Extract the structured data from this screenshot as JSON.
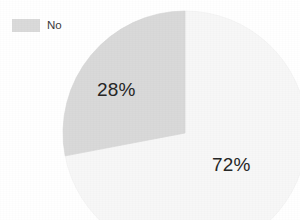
{
  "chart_data": {
    "type": "pie",
    "title": "",
    "subtitle": "",
    "xlabel": "",
    "ylabel": "",
    "grid": false,
    "legend_position": "top-left",
    "categories": [
      "No",
      "Yes"
    ],
    "values": [
      28,
      72
    ],
    "value_labels": [
      "28%",
      "72%"
    ],
    "slices": [
      {
        "label": "No",
        "value": 28,
        "value_label": "28%",
        "color": "#d9d9d9",
        "start_angle_deg": 259.2,
        "end_angle_deg": 360.0,
        "legend_visible": true
      },
      {
        "label": "",
        "value": 72,
        "value_label": "72%",
        "color": "#f7f7f7",
        "start_angle_deg": 0.0,
        "end_angle_deg": 259.2,
        "legend_visible": false
      }
    ],
    "geometry": {
      "center_x": 185,
      "center_y": 133,
      "radius": 122
    }
  },
  "legend": {
    "items": [
      {
        "label": "No",
        "swatch_color": "#dadada"
      }
    ]
  },
  "labels": {
    "slice_gray": "28%",
    "slice_white": "72%"
  },
  "colors": {
    "background": "#ffffff",
    "slice_gray": "#d9d9d9",
    "slice_white": "#f7f7f7",
    "slice_white_edge": "#ececec",
    "label_text": "#252525",
    "legend_text": "#3a3a3a"
  }
}
